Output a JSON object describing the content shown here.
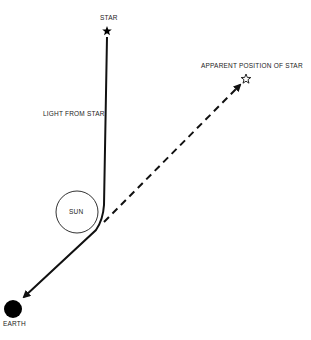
{
  "diagram": {
    "labels": {
      "star": "STAR",
      "apparent_position": "APPARENT POSITION OF STAR",
      "light_from_star": "LIGHT FROM STAR",
      "sun": "SUN",
      "earth": "EARTH"
    },
    "elements": {
      "star": {
        "x": 107,
        "y": 31,
        "icon": "filled-star-icon"
      },
      "apparent_star": {
        "x": 246,
        "y": 79,
        "icon": "outline-star-icon"
      },
      "sun": {
        "cx": 77,
        "cy": 212,
        "r": 21
      },
      "earth": {
        "cx": 13,
        "cy": 309,
        "r": 9
      },
      "light_path": {
        "from_star": [
          107,
          37
        ],
        "bend": [
          102,
          225
        ],
        "to_earth": [
          21,
          300
        ],
        "style": "solid"
      },
      "apparent_path": {
        "from": [
          104,
          222
        ],
        "to": [
          241,
          84
        ],
        "style": "dashed"
      }
    },
    "colors": {
      "line": "#111111",
      "background": "#ffffff",
      "text": "#222222"
    }
  }
}
